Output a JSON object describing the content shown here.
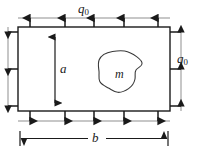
{
  "figure": {
    "type": "engineering-mechanics-diagram",
    "background_color": "#ffffff",
    "line_color": "#1a1a1a",
    "thin_line_color": "#8a8a8a",
    "labels": {
      "load_top": {
        "symbol": "q",
        "subscript": "0"
      },
      "load_right": {
        "symbol": "q",
        "subscript": "0"
      },
      "height_dimension": "a",
      "width_dimension": "b",
      "hole_label": "m"
    },
    "plate": {
      "x": 18,
      "y": 27,
      "width": 152,
      "height": 84
    },
    "loads": {
      "top": {
        "count": 5,
        "direction": "up"
      },
      "bottom": {
        "count": 5,
        "direction": "down"
      },
      "left": {
        "count": 3,
        "direction": "left"
      },
      "right": {
        "count": 3,
        "direction": "right"
      }
    },
    "top_arrow_x": [
      30,
      65,
      94,
      124,
      158
    ],
    "bottom_arrow_x": [
      30,
      65,
      94,
      124,
      158
    ],
    "side_arrow_y": [
      32,
      69,
      106
    ],
    "hole": {
      "label": "m",
      "center_x": 120,
      "center_y": 72
    },
    "dimension_a": {
      "x": 55,
      "y_top": 38,
      "y_bottom": 104
    },
    "dimension_b": {
      "y": 137,
      "x_left": 20,
      "x_right": 168
    }
  }
}
